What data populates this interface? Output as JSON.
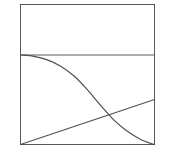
{
  "figure": {
    "title": "",
    "background_color": "#ffffff",
    "line_color": "#4f4f4f",
    "frame_color": "#575757"
  },
  "chart_data": {
    "type": "line",
    "title": "",
    "xlabel": "",
    "ylabel": "",
    "xlim": [
      0,
      1
    ],
    "ylim": [
      0,
      1
    ],
    "grid": false,
    "legend": false,
    "annotations": [
      {
        "name": "intersection",
        "x": 0.54,
        "y": 0.49,
        "label": ""
      }
    ],
    "reference_lines": [
      {
        "name": "upper-horizontal-divider",
        "orientation": "horizontal",
        "y": 1.0,
        "x_start": 0.0,
        "x_end": 1.0
      }
    ],
    "series": [
      {
        "name": "rising-line",
        "type": "line",
        "shape": "linear",
        "x": [
          0.0,
          0.25,
          0.5,
          0.75,
          1.0
        ],
        "values": [
          0.0,
          0.126,
          0.252,
          0.378,
          0.504
        ]
      },
      {
        "name": "falling-curve",
        "type": "line",
        "shape": "sigmoid-decay",
        "x": [
          0.0,
          0.1,
          0.2,
          0.3,
          0.4,
          0.5,
          0.6,
          0.7,
          0.8,
          0.9,
          1.0
        ],
        "values": [
          1.0,
          0.985,
          0.945,
          0.875,
          0.765,
          0.61,
          0.435,
          0.27,
          0.145,
          0.055,
          0.0
        ]
      }
    ],
    "frame": {
      "name": "plot-border",
      "x_range": [
        0.0,
        1.0
      ],
      "y_range": [
        0.0,
        1.0
      ]
    }
  }
}
